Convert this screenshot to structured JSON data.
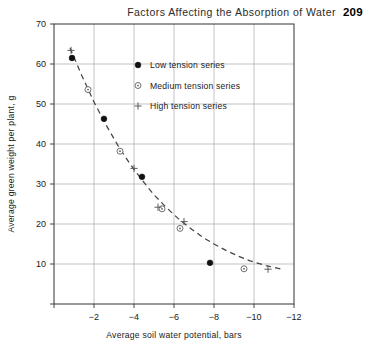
{
  "running_head": {
    "title": "Factors Affecting the Absorption of Water",
    "page_number": "209"
  },
  "chart_data": {
    "type": "scatter",
    "title": "",
    "xlabel": "Average soil water potential, bars",
    "ylabel": "Average green weight per plant, g",
    "xlim": [
      0,
      -12
    ],
    "ylim": [
      0,
      70
    ],
    "xticks": [
      0,
      -2,
      -4,
      -6,
      -8,
      -10,
      -12
    ],
    "xticklabels": [
      "",
      "-2",
      "-4",
      "-6",
      "-8",
      "-10",
      "-12"
    ],
    "yticks": [
      0,
      10,
      20,
      30,
      40,
      50,
      60,
      70
    ],
    "yticklabels": [
      "",
      "10",
      "20",
      "30",
      "40",
      "50",
      "60",
      "70"
    ],
    "grid": true,
    "legend_position": "upper-center",
    "series": [
      {
        "name": "Low tension series",
        "marker": "filled-circle",
        "color": "#111111",
        "points": [
          {
            "x": -0.9,
            "y": 61.5
          },
          {
            "x": -2.5,
            "y": 46.3
          },
          {
            "x": -4.4,
            "y": 31.8
          },
          {
            "x": -7.8,
            "y": 10.3
          }
        ]
      },
      {
        "name": "Medium tension series",
        "marker": "open-circle",
        "color": "#555555",
        "points": [
          {
            "x": -1.7,
            "y": 53.6
          },
          {
            "x": -3.3,
            "y": 38.2
          },
          {
            "x": -5.4,
            "y": 23.8
          },
          {
            "x": -6.3,
            "y": 18.9
          },
          {
            "x": -9.5,
            "y": 8.8
          }
        ]
      },
      {
        "name": "High tension series",
        "marker": "plus",
        "color": "#555555",
        "points": [
          {
            "x": -0.85,
            "y": 63.4
          },
          {
            "x": -4.0,
            "y": 33.9
          },
          {
            "x": -5.2,
            "y": 24.2
          },
          {
            "x": -6.5,
            "y": 20.6
          },
          {
            "x": -10.7,
            "y": 8.7
          }
        ]
      }
    ],
    "fit_curve": {
      "style": "dashed",
      "color": "#444444",
      "points": [
        {
          "x": -0.8,
          "y": 64.0
        },
        {
          "x": -1.4,
          "y": 57.0
        },
        {
          "x": -2.0,
          "y": 50.5
        },
        {
          "x": -2.6,
          "y": 44.8
        },
        {
          "x": -3.2,
          "y": 39.6
        },
        {
          "x": -3.8,
          "y": 35.0
        },
        {
          "x": -4.4,
          "y": 31.0
        },
        {
          "x": -5.0,
          "y": 27.3
        },
        {
          "x": -5.6,
          "y": 24.2
        },
        {
          "x": -6.2,
          "y": 21.4
        },
        {
          "x": -6.8,
          "y": 19.0
        },
        {
          "x": -7.4,
          "y": 16.8
        },
        {
          "x": -8.0,
          "y": 15.0
        },
        {
          "x": -8.6,
          "y": 13.4
        },
        {
          "x": -9.2,
          "y": 12.0
        },
        {
          "x": -9.8,
          "y": 10.8
        },
        {
          "x": -10.6,
          "y": 9.6
        },
        {
          "x": -11.4,
          "y": 8.7
        }
      ]
    }
  }
}
